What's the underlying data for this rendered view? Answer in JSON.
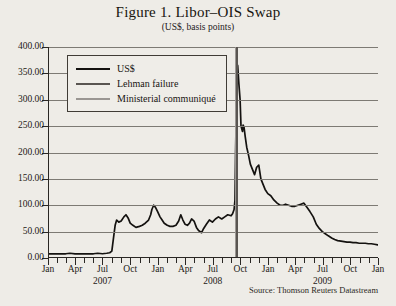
{
  "figure": {
    "title": "Figure 1. Libor–OIS Swap",
    "subtitle": "(US$, basis points)",
    "source": "Source: Thomson Reuters Datastream"
  },
  "colors": {
    "series_us": "#141210",
    "lehman_line": "#595551",
    "communique_line": "#9a9692",
    "grid": "#7d7a74",
    "axis": "#2a2724",
    "background": "#eeece7",
    "legend_background": "#efede8"
  },
  "legend": {
    "position": "top-left-inside",
    "items": [
      {
        "label": "US$",
        "color": "#141210"
      },
      {
        "label": "Lehman failure",
        "color": "#595551"
      },
      {
        "label": "Ministerial communiqué",
        "color": "#9a9692"
      }
    ]
  },
  "chart_data": {
    "type": "line",
    "title": "Figure 1. Libor–OIS Swap",
    "subtitle": "(US$, basis points)",
    "xlabel": "",
    "ylabel": "",
    "ylim": [
      0,
      400
    ],
    "yticks": [
      0,
      50,
      100,
      150,
      200,
      250,
      300,
      350,
      400
    ],
    "ytick_labels": [
      "0.00",
      "50.00",
      "100.00",
      "150.00",
      "200.00",
      "250.00",
      "300.00",
      "350.00",
      "400.00"
    ],
    "grid": true,
    "legend_position": "upper left",
    "xlim": [
      "2007-01",
      "2010-01"
    ],
    "xtick_labels": [
      "Jan",
      "Apr",
      "Jul",
      "Oct",
      "Jan",
      "Apr",
      "Jul",
      "Oct",
      "Jan",
      "Apr",
      "Jul",
      "Oct",
      "Jan"
    ],
    "xtick_values": [
      "2007-01",
      "2007-04",
      "2007-07",
      "2007-10",
      "2008-01",
      "2008-04",
      "2008-07",
      "2008-10",
      "2009-01",
      "2009-04",
      "2009-07",
      "2009-10",
      "2010-01"
    ],
    "year_labels": [
      "2007",
      "2008",
      "2009"
    ],
    "year_label_positions": [
      "2007-07",
      "2008-07",
      "2009-07"
    ],
    "annotations": [
      {
        "name": "Ministerial communiqué",
        "x": "2008-09-13",
        "color": "#9a9692",
        "type": "vline"
      },
      {
        "name": "Lehman failure",
        "x": "2008-09-15",
        "color": "#595551",
        "type": "vline"
      }
    ],
    "series": [
      {
        "name": "US$",
        "color": "#141210",
        "x": [
          "2007-01-01",
          "2007-01-15",
          "2007-02-01",
          "2007-02-15",
          "2007-03-01",
          "2007-03-15",
          "2007-04-01",
          "2007-04-15",
          "2007-05-01",
          "2007-05-15",
          "2007-06-01",
          "2007-06-15",
          "2007-07-01",
          "2007-07-15",
          "2007-07-25",
          "2007-08-01",
          "2007-08-07",
          "2007-08-12",
          "2007-08-17",
          "2007-08-24",
          "2007-09-01",
          "2007-09-10",
          "2007-09-17",
          "2007-09-24",
          "2007-10-01",
          "2007-10-10",
          "2007-10-20",
          "2007-11-01",
          "2007-11-10",
          "2007-11-20",
          "2007-12-01",
          "2007-12-08",
          "2007-12-12",
          "2007-12-18",
          "2007-12-24",
          "2007-12-31",
          "2008-01-08",
          "2008-01-15",
          "2008-01-22",
          "2008-02-01",
          "2008-02-10",
          "2008-02-20",
          "2008-03-01",
          "2008-03-10",
          "2008-03-17",
          "2008-03-24",
          "2008-03-31",
          "2008-04-08",
          "2008-04-15",
          "2008-04-22",
          "2008-04-30",
          "2008-05-08",
          "2008-05-15",
          "2008-05-25",
          "2008-06-01",
          "2008-06-10",
          "2008-06-20",
          "2008-06-30",
          "2008-07-10",
          "2008-07-20",
          "2008-07-31",
          "2008-08-10",
          "2008-08-20",
          "2008-08-31",
          "2008-09-05",
          "2008-09-10",
          "2008-09-13",
          "2008-09-15",
          "2008-09-18",
          "2008-09-22",
          "2008-09-26",
          "2008-09-30",
          "2008-10-03",
          "2008-10-08",
          "2008-10-10",
          "2008-10-13",
          "2008-10-17",
          "2008-10-22",
          "2008-10-28",
          "2008-11-03",
          "2008-11-10",
          "2008-11-17",
          "2008-11-24",
          "2008-12-01",
          "2008-12-08",
          "2008-12-15",
          "2008-12-22",
          "2008-12-31",
          "2009-01-10",
          "2009-01-20",
          "2009-01-31",
          "2009-02-10",
          "2009-02-20",
          "2009-02-28",
          "2009-03-10",
          "2009-03-20",
          "2009-03-31",
          "2009-04-10",
          "2009-04-20",
          "2009-04-30",
          "2009-05-10",
          "2009-05-20",
          "2009-05-31",
          "2009-06-10",
          "2009-06-20",
          "2009-06-30",
          "2009-07-10",
          "2009-07-20",
          "2009-07-31",
          "2009-08-10",
          "2009-08-20",
          "2009-08-31",
          "2009-09-10",
          "2009-09-20",
          "2009-09-30",
          "2009-10-10",
          "2009-10-20",
          "2009-10-31",
          "2009-11-10",
          "2009-11-20",
          "2009-11-30",
          "2009-12-10",
          "2009-12-20",
          "2009-12-31",
          "2010-01-01"
        ],
        "y": [
          8,
          8,
          8,
          8,
          8,
          9,
          8,
          8,
          8,
          8,
          8,
          9,
          8,
          9,
          10,
          13,
          40,
          62,
          72,
          68,
          70,
          78,
          82,
          76,
          66,
          62,
          58,
          60,
          62,
          66,
          72,
          82,
          92,
          100,
          96,
          88,
          78,
          72,
          66,
          62,
          60,
          60,
          62,
          70,
          82,
          72,
          64,
          62,
          66,
          74,
          70,
          58,
          52,
          48,
          56,
          64,
          72,
          68,
          74,
          78,
          74,
          78,
          82,
          80,
          84,
          92,
          110,
          200,
          300,
          365,
          330,
          300,
          250,
          240,
          252,
          248,
          230,
          210,
          195,
          178,
          168,
          158,
          172,
          176,
          150,
          140,
          130,
          122,
          118,
          110,
          104,
          100,
          100,
          102,
          100,
          98,
          98,
          100,
          102,
          104,
          96,
          88,
          78,
          64,
          56,
          50,
          46,
          42,
          38,
          35,
          33,
          32,
          31,
          30,
          30,
          29,
          29,
          28,
          28,
          28,
          27,
          27,
          26,
          25,
          25
        ]
      }
    ]
  }
}
